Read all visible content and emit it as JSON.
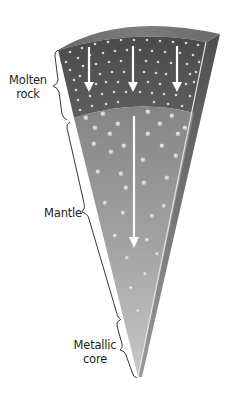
{
  "diagram": {
    "type": "layered-wedge cross-section",
    "layers": [
      {
        "name": "Molten rock",
        "lines": [
          "Molten",
          "rock"
        ]
      },
      {
        "name": "Mantle",
        "lines": [
          "Mantle"
        ]
      },
      {
        "name": "Metallic core",
        "lines": [
          "Metallic",
          "core"
        ]
      }
    ],
    "arrows": {
      "molten_layer_count": 3,
      "mantle_layer_count": 1,
      "direction": "down",
      "color": "#ffffff"
    },
    "colors": {
      "crust_top": "#6e6e6e",
      "molten_layer": "#555555",
      "mantle_top": "#8a8a8a",
      "mantle_bottom": "#b8b8b8",
      "side_face": "#5a5a5a",
      "dots_small": "#d8d8d8",
      "dots_large": "#c4c4c4",
      "brace_line": "#231f20",
      "label_text": "#231f20"
    }
  }
}
